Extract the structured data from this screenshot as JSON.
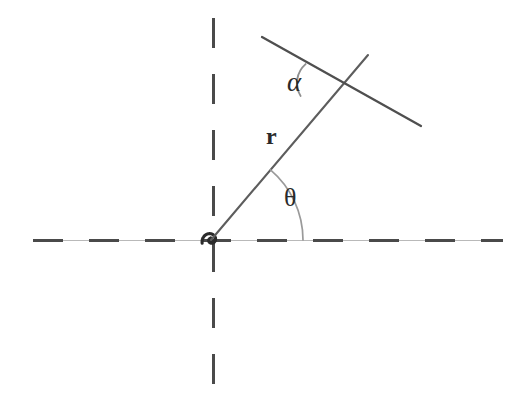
{
  "figure": {
    "kind": "geometric-diagram",
    "background_color": "#ffffff",
    "width": 527,
    "height": 414
  },
  "labels": {
    "alpha": "α",
    "radius": "r",
    "theta": "θ"
  },
  "colors": {
    "spiral_curve": "#2b2b2b",
    "axis_dashed": "#4a4a4a",
    "axis_hairline": "#b9b9b9",
    "radius_line": "#5d5d5d",
    "tangent_line": "#4f4f4f",
    "angle_arc": "#9a9a9a",
    "label_text": "#2a2a2a"
  },
  "geometry": {
    "center": {
      "x": 211,
      "y": 240
    },
    "spiral": {
      "type": "logarithmic",
      "equation": "r = a*e^(b*theta)",
      "a": 1.15,
      "b": 0.215,
      "theta_start_deg": -200,
      "theta_end_deg": 560,
      "stroke_width": 3.1,
      "direction": "counterclockwise",
      "outer_crossing_x": 457,
      "leftmost_x": 80,
      "topmost_y": 62,
      "bottommost_y": 337
    },
    "horizontal_axis": {
      "y": 240,
      "x_start": 33,
      "x_end": 503,
      "dash_pattern": "30 26",
      "stroke_width": 3
    },
    "vertical_axis": {
      "x": 213,
      "y_start": 18,
      "y_end": 392,
      "dash_pattern": "30 26",
      "stroke_width": 3
    },
    "radius_line": {
      "from": {
        "x": 211,
        "y": 240
      },
      "to": {
        "x": 368,
        "y": 55
      },
      "angle_deg": 49.7,
      "stroke_width": 2.1
    },
    "tangent_line": {
      "from": {
        "x": 262,
        "y": 37
      },
      "to": {
        "x": 421,
        "y": 126
      },
      "angle_deg": -29.2,
      "stroke_width": 2.3
    },
    "theta_arc": {
      "center": {
        "x": 211,
        "y": 240
      },
      "radius": 92,
      "start_deg": 0,
      "end_deg": 49.7,
      "stroke_width": 1.6
    },
    "alpha_arc": {
      "vertex": {
        "x": 322,
        "y": 83
      },
      "radius": 25,
      "from_deg": 131,
      "to_deg": 211,
      "stroke_width": 1.8
    },
    "tangent_point": {
      "x": 322,
      "y": 83
    }
  }
}
